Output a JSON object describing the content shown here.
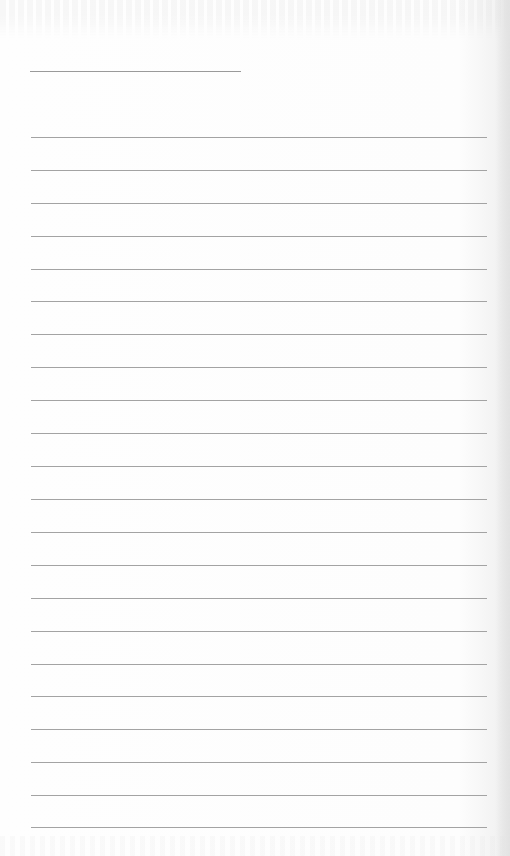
{
  "document": {
    "type": "lined-paper",
    "header_line": {
      "x": 30,
      "y": 71,
      "width": 211
    },
    "ruled_lines": {
      "count": 22,
      "x": 31,
      "width": 456,
      "positions_y": [
        137,
        170,
        203,
        236,
        269,
        301,
        334,
        367,
        400,
        433,
        466,
        499,
        532,
        565,
        598,
        631,
        664,
        696,
        729,
        762,
        795,
        827
      ]
    },
    "colors": {
      "paper": "#fdfdfd",
      "line": "#a3a3a3",
      "header_line": "#9a9a9a"
    }
  }
}
